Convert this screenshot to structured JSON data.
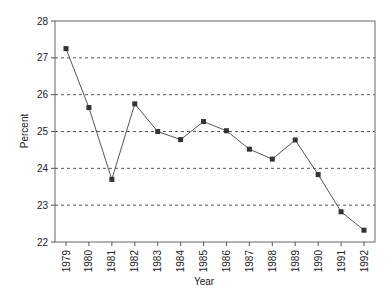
{
  "chart_data": {
    "type": "line",
    "title": "",
    "xlabel": "Year",
    "ylabel": "Percent",
    "categories": [
      "1979",
      "1980",
      "1981",
      "1982",
      "1983",
      "1984",
      "1985",
      "1986",
      "1987",
      "1988",
      "1989",
      "1990",
      "1991",
      "1992"
    ],
    "series": [
      {
        "name": "Percent",
        "values": [
          27.25,
          25.65,
          23.7,
          25.75,
          25.0,
          24.78,
          25.27,
          25.02,
          24.52,
          24.25,
          24.77,
          23.83,
          22.82,
          22.32
        ],
        "marker": "square",
        "color": "#333333"
      }
    ],
    "ylim": [
      22,
      28
    ],
    "yticks": [
      22,
      23,
      24,
      25,
      26,
      27,
      28
    ],
    "grid": {
      "y": true,
      "style": "dashed",
      "x": false
    },
    "legend": null
  }
}
